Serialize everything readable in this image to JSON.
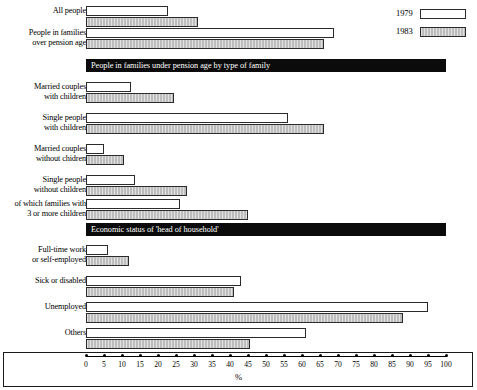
{
  "legend": {
    "items": [
      {
        "label": "1979",
        "swatch": "hollow-white-bar"
      },
      {
        "label": "1983",
        "swatch": "gray-hatched-bar"
      }
    ]
  },
  "axis": {
    "title": "%",
    "ticks": [
      0,
      5,
      10,
      15,
      20,
      25,
      30,
      35,
      40,
      45,
      50,
      55,
      60,
      65,
      70,
      75,
      80,
      85,
      90,
      95,
      100
    ]
  },
  "banners": {
    "family_type": "People in families under pension age by type of family",
    "economic_status": "Economic status of 'head of household'"
  },
  "rows": [
    {
      "label_line1": "All people",
      "label_line2": "",
      "v1979": 22.8,
      "v1983": 31.0
    },
    {
      "label_line1": "People in families",
      "label_line2": "over pension age",
      "v1979": 69.0,
      "v1983": 66.0
    },
    {
      "label_line1": "Married couples",
      "label_line2": "with children",
      "v1979": 12.5,
      "v1983": 24.5
    },
    {
      "label_line1": "Single people",
      "label_line2": "with children",
      "v1979": 56.0,
      "v1983": 66.0
    },
    {
      "label_line1": "Married couples",
      "label_line2": "without chidren",
      "v1979": 5.0,
      "v1983": 10.5
    },
    {
      "label_line1": "Single people",
      "label_line2": "without children",
      "v1979": 13.5,
      "v1983": 28.0
    },
    {
      "label_line1": "of which families with",
      "label_line2": "3 or more children",
      "v1979": 26.0,
      "v1983": 45.0
    },
    {
      "label_line1": "Full-time work",
      "label_line2": "or self-employed",
      "v1979": 6.0,
      "v1983": 12.0
    },
    {
      "label_line1": "Sick or disabled",
      "label_line2": "",
      "v1979": 43.0,
      "v1983": 41.0
    },
    {
      "label_line1": "Unemployed",
      "label_line2": "",
      "v1979": 95.0,
      "v1983": 88.0
    },
    {
      "label_line1": "Others",
      "label_line2": "",
      "v1979": 61.0,
      "v1983": 45.5
    }
  ],
  "chart_data": {
    "type": "bar",
    "orientation": "horizontal",
    "title": "",
    "xlabel": "%",
    "ylabel": "",
    "xlim": [
      0,
      100
    ],
    "xticks": [
      0,
      5,
      10,
      15,
      20,
      25,
      30,
      35,
      40,
      45,
      50,
      55,
      60,
      65,
      70,
      75,
      80,
      85,
      90,
      95,
      100
    ],
    "grid": false,
    "legend_position": "top-right",
    "categories": [
      "All people",
      "People in families over pension age",
      "Married couples with children",
      "Single people with children",
      "Married couples without chidren",
      "Single people without children",
      "of which families with 3 or more children",
      "Full-time work or self-employed",
      "Sick or disabled",
      "Unemployed",
      "Others"
    ],
    "series": [
      {
        "name": "1979",
        "values": [
          22.8,
          69.0,
          12.5,
          56.0,
          5.0,
          13.5,
          26.0,
          6.0,
          43.0,
          95.0,
          61.0
        ]
      },
      {
        "name": "1983",
        "values": [
          31.0,
          66.0,
          24.5,
          66.0,
          10.5,
          28.0,
          45.0,
          12.0,
          41.0,
          88.0,
          45.5
        ]
      }
    ],
    "section_headers": [
      {
        "after_category": "People in families over pension age",
        "text": "People in families under pension age by type of family"
      },
      {
        "after_category": "of which families with 3 or more children",
        "text": "Economic status of 'head of household'"
      }
    ]
  }
}
